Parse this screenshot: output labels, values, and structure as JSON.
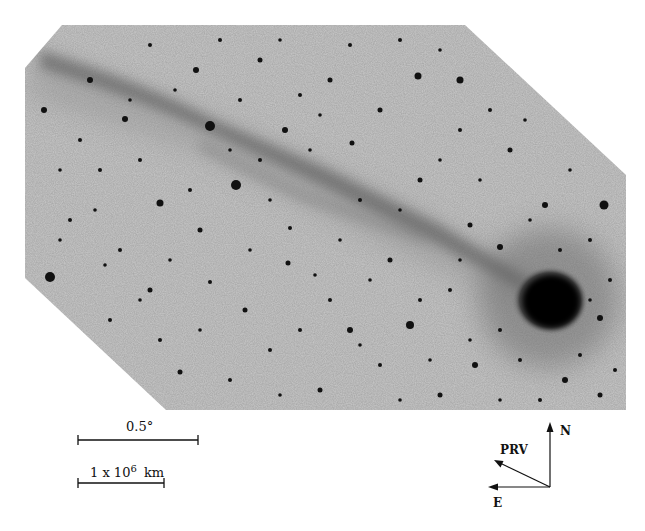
{
  "figure": {
    "colors": {
      "background": "#ffffff",
      "sky": "#c9c9c9",
      "stars": "#111111",
      "coma": "#050505",
      "ink": "#111111"
    }
  },
  "scale_bars": {
    "angular": {
      "label": "0.5°"
    },
    "distance": {
      "label_prefix": "1 x 10",
      "label_exponent": "6",
      "label_unit": "km"
    }
  },
  "compass": {
    "north": "N",
    "east": "E",
    "prv": "PRV"
  }
}
